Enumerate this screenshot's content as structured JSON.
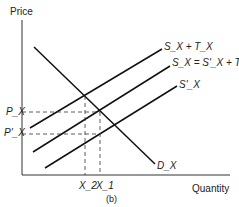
{
  "diagram": {
    "y_axis_label": "Price",
    "x_axis_label": "Quantity",
    "caption": "(b)",
    "curves": {
      "supply_plus_tax": "S_X + T_X",
      "supply_equals": "S_X = S'_X + T_X",
      "supply_prime": "S'_X",
      "demand": "D_X"
    },
    "price_labels": [
      "P_X",
      "P'_X"
    ],
    "quantity_labels": [
      "X_2",
      "X_1"
    ]
  }
}
